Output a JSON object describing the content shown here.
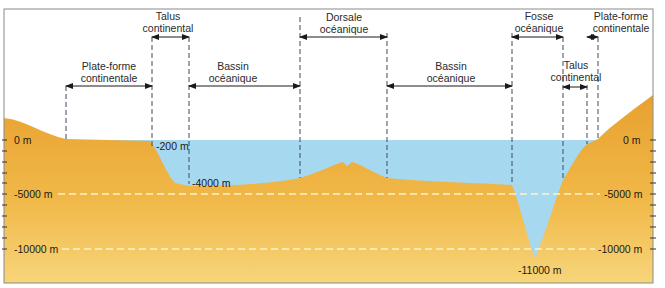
{
  "diagram": {
    "colors": {
      "land_top": "#e9a12e",
      "land_bottom": "#f7d57a",
      "water": "#a6d8ef",
      "frame": "#8a8a8a",
      "guide_line": "#3c4a5c",
      "dashed_level": "#fff3c8",
      "text": "#2a2a2a"
    },
    "regions": [
      {
        "id": "plate-forme-continentale-left",
        "line1": "Plate-forme",
        "line2": "continentale"
      },
      {
        "id": "talus-continental-left",
        "line1": "Talus",
        "line2": "continental"
      },
      {
        "id": "bassin-oceanique-left",
        "line1": "Bassin",
        "line2": "océanique"
      },
      {
        "id": "dorsale-oceanique",
        "line1": "Dorsale",
        "line2": "océanique"
      },
      {
        "id": "bassin-oceanique-right",
        "line1": "Bassin",
        "line2": "océanique"
      },
      {
        "id": "fosse-oceanique",
        "line1": "Fosse",
        "line2": "océanique"
      },
      {
        "id": "talus-continental-right",
        "line1": "Talus",
        "line2": "continental"
      },
      {
        "id": "plate-forme-continentale-right",
        "line1": "Plate-forme",
        "line2": "continentale"
      }
    ],
    "axis_left": [
      "0 m",
      "-5000 m",
      "-10000 m"
    ],
    "axis_right": [
      "0 m",
      "-5000 m",
      "-10000 m"
    ],
    "annotations": {
      "shelf_edge": "-200 m",
      "basin_floor": "-4000 m",
      "trench_bottom": "-11000 m"
    }
  }
}
